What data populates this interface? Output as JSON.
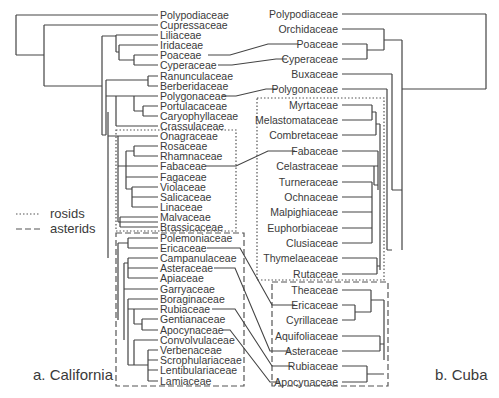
{
  "figure": {
    "panel_a_label": "a. California",
    "panel_b_label": "b. Cuba",
    "legend": [
      {
        "style": "dotted",
        "label": "rosids"
      },
      {
        "style": "dashed",
        "label": "asterids"
      }
    ]
  },
  "left_tree": {
    "title": "a. California",
    "taxa": [
      {
        "name": "Polypodiaceae",
        "y": 15
      },
      {
        "name": "Cupressaceae",
        "y": 25
      },
      {
        "name": "Liliaceae",
        "y": 35
      },
      {
        "name": "Iridaceae",
        "y": 45
      },
      {
        "name": "Poaceae",
        "y": 55
      },
      {
        "name": "Cyperaceae",
        "y": 65
      },
      {
        "name": "Ranunculaceae",
        "y": 76
      },
      {
        "name": "Berberidaceae",
        "y": 86
      },
      {
        "name": "Polygonaceae",
        "y": 96
      },
      {
        "name": "Portulacaceae",
        "y": 106
      },
      {
        "name": "Caryophyllaceae",
        "y": 116
      },
      {
        "name": "Crassulaceae",
        "y": 126
      },
      {
        "name": "Onagraceae",
        "y": 136
      },
      {
        "name": "Rosaceae",
        "y": 146
      },
      {
        "name": "Rhamnaceae",
        "y": 156
      },
      {
        "name": "Fabaceae",
        "y": 166
      },
      {
        "name": "Fagaceae",
        "y": 177
      },
      {
        "name": "Violaceae",
        "y": 187
      },
      {
        "name": "Salicaceae",
        "y": 197
      },
      {
        "name": "Linaceae",
        "y": 207
      },
      {
        "name": "Malvaceae",
        "y": 217
      },
      {
        "name": "Brassicaceae",
        "y": 227
      },
      {
        "name": "Polemoniaceae",
        "y": 238
      },
      {
        "name": "Ericaceae",
        "y": 248
      },
      {
        "name": "Campanulaceae",
        "y": 258
      },
      {
        "name": "Asteraceae",
        "y": 268
      },
      {
        "name": "Apiaceae",
        "y": 278
      },
      {
        "name": "Garryaceae",
        "y": 289
      },
      {
        "name": "Boraginaceae",
        "y": 299
      },
      {
        "name": "Rubiaceae",
        "y": 309
      },
      {
        "name": "Gentianaceae",
        "y": 319
      },
      {
        "name": "Apocynaceae",
        "y": 330
      },
      {
        "name": "Convolvulaceae",
        "y": 340
      },
      {
        "name": "Verbenaceae",
        "y": 350
      },
      {
        "name": "Scrophulariaceae",
        "y": 360
      },
      {
        "name": "Lentibulariaceae",
        "y": 370
      },
      {
        "name": "Lamiaceae",
        "y": 381
      }
    ],
    "groups": {
      "rosids": [
        "Onagraceae",
        "Rosaceae",
        "Rhamnaceae",
        "Fabaceae",
        "Fagaceae",
        "Violaceae",
        "Salicaceae",
        "Linaceae",
        "Malvaceae",
        "Brassicaceae"
      ],
      "asterids": [
        "Polemoniaceae",
        "Ericaceae",
        "Campanulaceae",
        "Asteraceae",
        "Apiaceae",
        "Garryaceae",
        "Boraginaceae",
        "Rubiaceae",
        "Gentianaceae",
        "Apocynaceae",
        "Convolvulaceae",
        "Verbenaceae",
        "Scrophulariaceae",
        "Lentibulariaceae",
        "Lamiaceae"
      ]
    }
  },
  "right_tree": {
    "title": "b. Cuba",
    "taxa": [
      {
        "name": "Polypodiaceae",
        "y": 14
      },
      {
        "name": "Orchidaceae",
        "y": 29
      },
      {
        "name": "Poaceae",
        "y": 44
      },
      {
        "name": "Cyperaceae",
        "y": 59
      },
      {
        "name": "Buxaceae",
        "y": 74
      },
      {
        "name": "Polygonaceae",
        "y": 89
      },
      {
        "name": "Myrtaceae",
        "y": 105
      },
      {
        "name": "Melastomataceae",
        "y": 120
      },
      {
        "name": "Combretaceae",
        "y": 135
      },
      {
        "name": "Fabaceae",
        "y": 151
      },
      {
        "name": "Celastraceae",
        "y": 166
      },
      {
        "name": "Turneraceae",
        "y": 182
      },
      {
        "name": "Ochnaceae",
        "y": 197
      },
      {
        "name": "Malpighiaceae",
        "y": 212
      },
      {
        "name": "Euphorbiaceae",
        "y": 228
      },
      {
        "name": "Clusiaceae",
        "y": 243
      },
      {
        "name": "Thymelaeaceae",
        "y": 258
      },
      {
        "name": "Rutaceae",
        "y": 274
      },
      {
        "name": "Theaceae",
        "y": 290
      },
      {
        "name": "Ericaceae",
        "y": 305
      },
      {
        "name": "Cyrillaceae",
        "y": 320
      },
      {
        "name": "Aquifoliaceae",
        "y": 336
      },
      {
        "name": "Asteraceae",
        "y": 351
      },
      {
        "name": "Rubiaceae",
        "y": 366
      },
      {
        "name": "Apocynaceae",
        "y": 382
      }
    ],
    "groups": {
      "rosids": [
        "Myrtaceae",
        "Melastomataceae",
        "Combretaceae",
        "Fabaceae",
        "Celastraceae",
        "Turneraceae",
        "Ochnaceae",
        "Malpighiaceae",
        "Euphorbiaceae",
        "Clusiaceae",
        "Thymelaeaceae",
        "Rutaceae"
      ],
      "asterids": [
        "Theaceae",
        "Ericaceae",
        "Cyrillaceae",
        "Aquifoliaceae",
        "Asteraceae",
        "Rubiaceae",
        "Apocynaceae"
      ]
    }
  },
  "shared_links": [
    "Poaceae",
    "Cyperaceae",
    "Polygonaceae",
    "Fabaceae",
    "Ericaceae",
    "Asteraceae",
    "Rubiaceae",
    "Apocynaceae"
  ]
}
